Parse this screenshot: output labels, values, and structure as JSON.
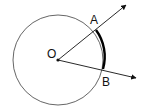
{
  "diagram": {
    "type": "circle-sector-arc",
    "colors": {
      "stroke": "#555555",
      "ink": "#111111",
      "background": "#ffffff"
    },
    "circle": {
      "cx": 58,
      "cy": 60,
      "r": 45
    },
    "center": {
      "label": "O",
      "x": 58,
      "y": 60
    },
    "points": [
      {
        "label": "A",
        "x": 96,
        "y": 30
      },
      {
        "label": "B",
        "x": 103,
        "y": 69
      }
    ],
    "rays": [
      {
        "from": "O",
        "through": "A",
        "tip": {
          "x": 126,
          "y": 5
        }
      },
      {
        "from": "O",
        "through": "B",
        "tip": {
          "x": 136,
          "y": 78
        }
      }
    ],
    "highlighted_arc": {
      "from": "A",
      "to": "B",
      "style": "bold"
    }
  }
}
